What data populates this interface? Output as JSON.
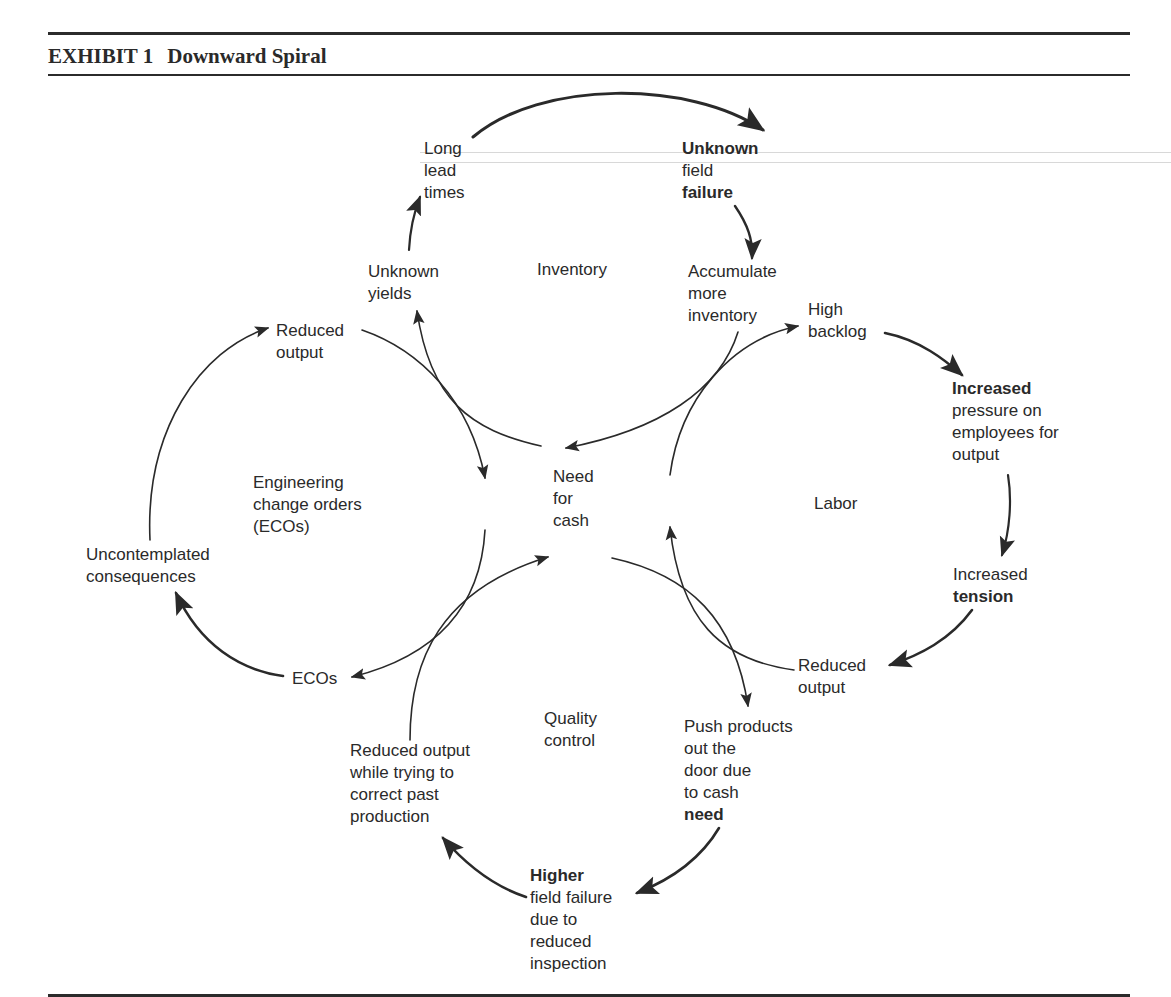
{
  "header": {
    "exhibit_label": "EXHIBIT 1",
    "title": "Downward Spiral"
  },
  "center": {
    "lines": [
      "Need",
      "for",
      "cash"
    ]
  },
  "loops": {
    "inventory": {
      "name": "Inventory",
      "nodes": {
        "long_lead_times": [
          "Long",
          "lead",
          "times"
        ],
        "unknown_field_failure": [
          "Unknown",
          "field",
          "failure"
        ],
        "accumulate_more_inventory": [
          "Accumulate",
          "more",
          "inventory"
        ],
        "unknown_yields": [
          "Unknown",
          "yields"
        ]
      }
    },
    "labor": {
      "name": "Labor",
      "nodes": {
        "high_backlog": [
          "High",
          "backlog"
        ],
        "increased_pressure": [
          "Increased",
          "pressure on",
          "employees for",
          "output"
        ],
        "increased_tension": [
          "Increased",
          "tension"
        ],
        "reduced_output": [
          "Reduced",
          "output"
        ]
      }
    },
    "quality_control": {
      "name_lines": [
        "Quality",
        "control"
      ],
      "nodes": {
        "push_products": [
          "Push products",
          "out the",
          "door due",
          "to cash",
          "need"
        ],
        "higher_field_failure": [
          "Higher",
          "field failure",
          "due to",
          "reduced",
          "inspection"
        ],
        "reduced_output_correcting": [
          "Reduced output",
          "while trying to",
          "correct past",
          "production"
        ]
      }
    },
    "eco": {
      "name_lines": [
        "Engineering",
        "change orders",
        "(ECOs)"
      ],
      "nodes": {
        "reduced_output": [
          "Reduced",
          "output"
        ],
        "uncontemplated_consequences": [
          "Uncontemplated",
          "consequences"
        ],
        "ecos": [
          "ECOs"
        ]
      }
    }
  },
  "colors": {
    "ink": "#2a2a2a",
    "paper": "#ffffff"
  }
}
